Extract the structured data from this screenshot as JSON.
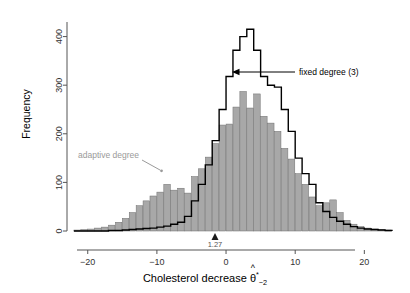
{
  "figure": {
    "x_axis_title_prefix": "Cholesterol decrease ",
    "x_axis_theta": "θ",
    "x_axis_hat": "^",
    "x_axis_sup": "*",
    "x_axis_sub": "−2",
    "y_axis_title": "Frequency",
    "point_estimate_label": "1.27",
    "annotation_fixed": "fixed degree (3)",
    "annotation_adaptive": "adaptive degree",
    "colors": {
      "bar_fill": "#a8a8a8",
      "bar_edge": "#6e6e6e",
      "outline": "#000000",
      "adaptive_label": "#8a8a8a",
      "axis": "#555555",
      "background": "#ffffff"
    }
  },
  "chart_data": {
    "type": "bar",
    "title": "",
    "xlabel": "Cholesterol decrease θ̂*₋₂",
    "ylabel": "Frequency",
    "xlim": [
      -23,
      24
    ],
    "ylim": [
      0,
      430
    ],
    "xticks": [
      -20,
      -10,
      0,
      10,
      20
    ],
    "yticks": [
      0,
      100,
      200,
      300,
      400
    ],
    "grid": false,
    "legend_position": "inline-annotations",
    "point_estimate": 1.27,
    "bin_width": 1,
    "series": [
      {
        "name": "adaptive degree",
        "style": "filled-gray-bars",
        "bin_starts": [
          -22,
          -21,
          -20,
          -19,
          -18,
          -17,
          -16,
          -15,
          -14,
          -13,
          -12,
          -11,
          -10,
          -9,
          -8,
          -7,
          -6,
          -5,
          -4,
          -3,
          -2,
          -1,
          0,
          1,
          2,
          3,
          4,
          5,
          6,
          7,
          8,
          9,
          10,
          11,
          12,
          13,
          14,
          15,
          16,
          17,
          18,
          19,
          20,
          21,
          22,
          23
        ],
        "values": [
          2,
          3,
          4,
          6,
          8,
          12,
          18,
          26,
          38,
          52,
          62,
          72,
          80,
          96,
          84,
          88,
          78,
          112,
          128,
          152,
          180,
          218,
          220,
          255,
          287,
          253,
          282,
          236,
          222,
          205,
          170,
          148,
          118,
          96,
          70,
          52,
          58,
          64,
          38,
          22,
          14,
          9,
          6,
          4,
          3,
          2
        ]
      },
      {
        "name": "fixed degree (3)",
        "style": "black-step-outline",
        "bin_starts": [
          -22,
          -21,
          -20,
          -19,
          -18,
          -17,
          -16,
          -15,
          -14,
          -13,
          -12,
          -11,
          -10,
          -9,
          -8,
          -7,
          -6,
          -5,
          -4,
          -3,
          -2,
          -1,
          0,
          1,
          2,
          3,
          4,
          5,
          6,
          7,
          8,
          9,
          10,
          11,
          12,
          13,
          14,
          15,
          16,
          17,
          18,
          19,
          20,
          21,
          22,
          23
        ],
        "values": [
          0,
          0,
          0,
          0,
          0,
          1,
          1,
          2,
          3,
          4,
          5,
          6,
          8,
          10,
          14,
          18,
          30,
          62,
          96,
          136,
          186,
          250,
          318,
          372,
          400,
          415,
          372,
          318,
          300,
          296,
          250,
          205,
          150,
          118,
          96,
          58,
          40,
          28,
          20,
          14,
          9,
          6,
          4,
          3,
          2,
          1
        ]
      }
    ]
  }
}
